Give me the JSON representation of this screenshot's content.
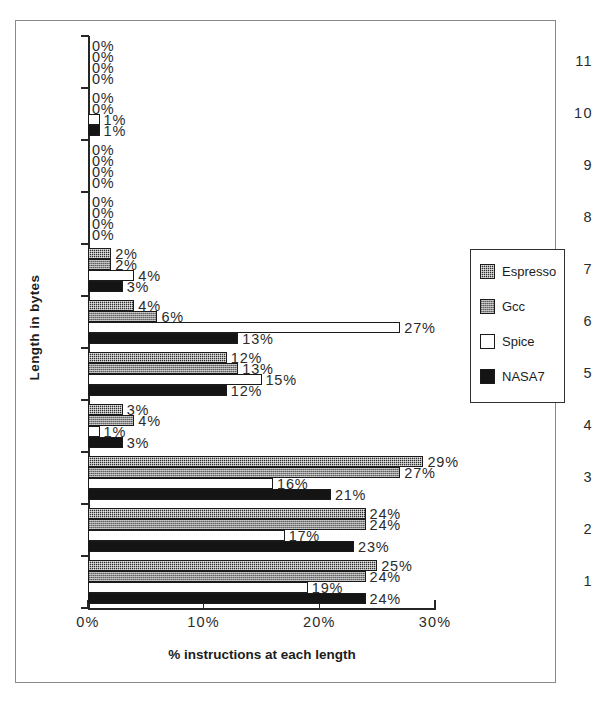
{
  "chart_data": {
    "type": "bar",
    "orientation": "horizontal",
    "title": "",
    "xlabel": "% instructions at each length",
    "ylabel": "Length in bytes",
    "xlim": [
      0,
      30
    ],
    "xticks": [
      "0%",
      "10%",
      "20%",
      "30%"
    ],
    "xtick_values": [
      0,
      10,
      20,
      30
    ],
    "grid": false,
    "legend_position": "right",
    "categories": [
      "1",
      "2",
      "3",
      "4",
      "5",
      "6",
      "7",
      "8",
      "9",
      "10",
      "11"
    ],
    "series": [
      {
        "name": "Espresso",
        "values": [
          25,
          24,
          29,
          3,
          12,
          4,
          2,
          0,
          0,
          0,
          0
        ],
        "labels": [
          "25%",
          "24%",
          "29%",
          "3%",
          "12%",
          "4%",
          "2%",
          "0%",
          "0%",
          "0%",
          "0%"
        ]
      },
      {
        "name": "Gcc",
        "values": [
          24,
          24,
          27,
          4,
          13,
          6,
          2,
          0,
          0,
          0,
          0
        ],
        "labels": [
          "24%",
          "24%",
          "27%",
          "4%",
          "13%",
          "6%",
          "2%",
          "0%",
          "0%",
          "0%",
          "0%"
        ]
      },
      {
        "name": "Spice",
        "values": [
          19,
          17,
          16,
          1,
          15,
          27,
          4,
          0,
          0,
          1,
          0
        ],
        "labels": [
          "19%",
          "17%",
          "16%",
          "1%",
          "15%",
          "27%",
          "4%",
          "0%",
          "0%",
          "1%",
          "0%"
        ]
      },
      {
        "name": "NASA7",
        "values": [
          24,
          23,
          21,
          3,
          12,
          13,
          3,
          0,
          0,
          1,
          0
        ],
        "labels": [
          "24%",
          "23%",
          "21%",
          "3%",
          "12%",
          "13%",
          "3%",
          "0%",
          "0%",
          "1%",
          "0%"
        ]
      }
    ]
  },
  "legend": {
    "entries": [
      {
        "label": "Espresso",
        "swatch": "espresso-pattern-swatch",
        "color": "#2e2e2e"
      },
      {
        "label": "Gcc",
        "swatch": "gcc-pattern-swatch",
        "color": "#8d8d8d"
      },
      {
        "label": "Spice",
        "swatch": "spice-white-swatch",
        "color": "#ffffff"
      },
      {
        "label": "NASA7",
        "swatch": "nasa7-black-swatch",
        "color": "#141414"
      }
    ]
  }
}
